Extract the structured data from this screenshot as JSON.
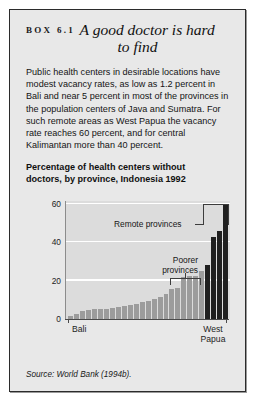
{
  "box": {
    "number_label": "BOX 6.1",
    "title_line1": "A good doctor is hard",
    "title_line2": "to find",
    "body": "Public health centers in desirable locations have modest vacancy rates, as low as 1.2 percent in Bali and near 5 percent in most of the provinces in the population centers of Java and Sumatra. For such remote areas as West Papua the vacancy rate reaches 60 percent, and for central Kalimantan more than 40 percent.",
    "source": "Source: World Bank (1994b)."
  },
  "chart_heading": {
    "line1": "Percentage of health centers without",
    "line2": "doctors, by province, Indonesia 1992"
  },
  "annotations": {
    "remote": "Remote provinces",
    "poorer_line1": "Poorer",
    "poorer_line2": "provinces"
  },
  "chart_data": {
    "type": "bar",
    "title": "Percentage of health centers without doctors, by province, Indonesia 1992",
    "xlabel": "",
    "ylabel": "",
    "ylim": [
      0,
      62
    ],
    "yticks": [
      0,
      20,
      40,
      60
    ],
    "ytick_labels": [
      "0",
      "20",
      "40",
      "60"
    ],
    "grid": true,
    "legend": false,
    "xtick_labels": [
      "Bali",
      "West Papua"
    ],
    "xtick_label_right_line1": "West",
    "xtick_label_right_line2": "Papua",
    "categories": [
      "Bali",
      "p2",
      "p3",
      "p4",
      "p5",
      "p6",
      "p7",
      "p8",
      "p9",
      "p10",
      "p11",
      "p12",
      "p13",
      "p14",
      "p15",
      "p16",
      "p17",
      "p18",
      "p19",
      "p20",
      "p21",
      "p22",
      "p23",
      "p24",
      "p25",
      "p26",
      "West Papua"
    ],
    "values": [
      1.2,
      2.5,
      4.0,
      4.5,
      4.8,
      5.0,
      5.2,
      5.5,
      6.0,
      6.5,
      7.0,
      7.5,
      8.5,
      9.5,
      10.5,
      11.5,
      13.0,
      15.5,
      16.0,
      22.0,
      22.5,
      22.5,
      25.0,
      28.0,
      43.0,
      46.0,
      60.0
    ],
    "bar_colors": [
      "light",
      "light",
      "light",
      "light",
      "light",
      "light",
      "light",
      "light",
      "light",
      "light",
      "light",
      "light",
      "light",
      "light",
      "light",
      "light",
      "light",
      "light",
      "light",
      "light",
      "light",
      "light",
      "light",
      "dark",
      "dark",
      "dark",
      "dark"
    ],
    "annotation_groups": [
      {
        "label": "Poorer provinces",
        "from_index": 19,
        "to_index": 23
      },
      {
        "label": "Remote provinces",
        "from_index": 24,
        "to_index": 26
      }
    ]
  },
  "colors": {
    "box_background": "#e8e8e8",
    "box_border": "#2b2b2b",
    "plot_background": "#dcdcdc",
    "gridline": "#ffffff",
    "bar_light": "#9c9c9c",
    "bar_dark": "#1f1f1f"
  }
}
